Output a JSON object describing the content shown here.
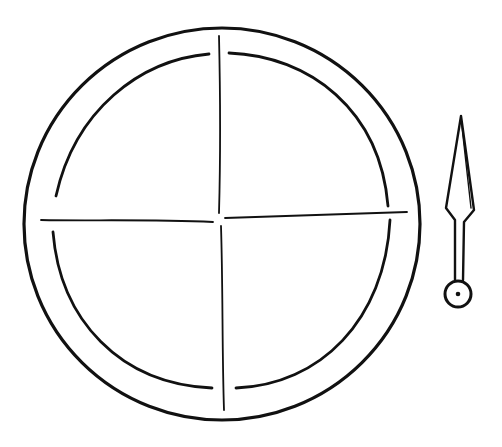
{
  "figure": {
    "colors": {
      "background": "#ffffff",
      "ink": "#111111"
    },
    "board": {
      "center": [
        222,
        224
      ],
      "outer_radius": 198,
      "inner_radius": 172,
      "sections": 4
    },
    "spinner": {
      "tip": [
        461,
        116
      ],
      "pivot": [
        458,
        296
      ]
    }
  }
}
